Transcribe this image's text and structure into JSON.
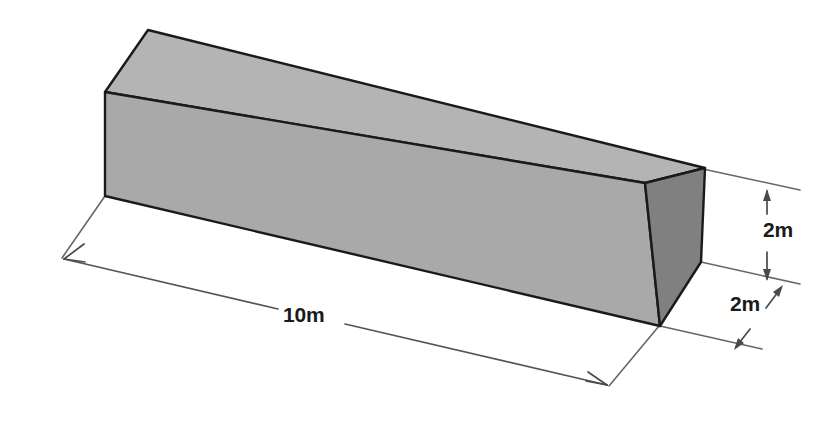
{
  "figure": {
    "shape": "rectangular-prism",
    "units": "m",
    "background_color": "#ffffff",
    "outline_color": "#1a1a1a",
    "dimension_line_color": "#555555",
    "faces": {
      "top": {
        "name": "top-face",
        "fill": "#b4b4b4"
      },
      "front": {
        "name": "front-face",
        "fill": "#a9a9a9"
      },
      "end": {
        "name": "right-end-face",
        "fill": "#808080"
      }
    },
    "dimensions": [
      {
        "id": "length",
        "label": "10m",
        "value": 10,
        "unit": "m",
        "edge": "length"
      },
      {
        "id": "height",
        "label": "2m",
        "value": 2,
        "unit": "m",
        "edge": "height"
      },
      {
        "id": "depth",
        "label": "2m",
        "value": 2,
        "unit": "m",
        "edge": "depth"
      }
    ]
  },
  "labels": {
    "length": "10m",
    "height": "2m",
    "depth": "2m"
  }
}
